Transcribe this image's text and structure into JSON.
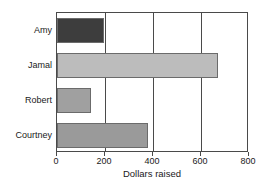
{
  "chart_data": {
    "type": "bar",
    "orientation": "horizontal",
    "title": "",
    "xlabel": "Dollars raised",
    "ylabel": "",
    "categories": [
      "Amy",
      "Jamal",
      "Robert",
      "Courtney"
    ],
    "values": [
      195,
      670,
      140,
      380
    ],
    "xlim": [
      0,
      800
    ],
    "xticks": [
      0,
      200,
      400,
      600,
      800
    ],
    "xtick_labels": [
      "0",
      "200",
      "400",
      "600",
      "800"
    ],
    "grid": true,
    "grid_axis": "x",
    "legend": false,
    "bar_colors": [
      "#3d3d3d",
      "#bcbcbc",
      "#a0a0a0",
      "#9a9a9a"
    ],
    "bar_edge_color": "#6b6b6b",
    "axis_color": "#4a4a4a",
    "background": "#ffffff",
    "bars": [
      {
        "category": "Amy",
        "value": 195,
        "color": "#3d3d3d"
      },
      {
        "category": "Jamal",
        "value": 670,
        "color": "#bcbcbc"
      },
      {
        "category": "Robert",
        "value": 140,
        "color": "#a0a0a0"
      },
      {
        "category": "Courtney",
        "value": 380,
        "color": "#9a9a9a"
      }
    ]
  }
}
